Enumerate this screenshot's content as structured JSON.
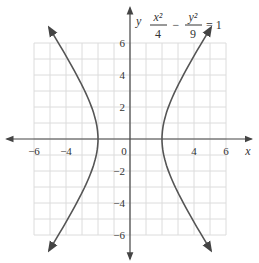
{
  "chart_data": {
    "type": "line",
    "equation": {
      "term1_num": "x²",
      "term1_den": "4",
      "minus": "−",
      "term2_num": "y²",
      "term2_den": "9",
      "rhs": "= 1"
    },
    "xlabel": "x",
    "ylabel": "y",
    "xlim": [
      -7,
      7
    ],
    "ylim": [
      -7,
      7
    ],
    "grid": true,
    "x_ticks": [
      "−6",
      "−4",
      "0",
      "4",
      "6"
    ],
    "y_ticks": [
      "6",
      "4",
      "2",
      "−2",
      "−4",
      "−6"
    ],
    "series": [
      {
        "name": "right branch",
        "x": [
          3.7,
          3.0,
          2.5,
          2.2,
          2.0,
          2.2,
          2.5,
          3.0,
          3.7
        ],
        "y": [
          -4.7,
          -3.35,
          -2.25,
          -1.37,
          0,
          1.37,
          2.25,
          3.35,
          4.7
        ]
      },
      {
        "name": "left branch",
        "x": [
          -3.7,
          -3.0,
          -2.5,
          -2.2,
          -2.0,
          -2.2,
          -2.5,
          -3.0,
          -3.7
        ],
        "y": [
          -4.7,
          -3.35,
          -2.25,
          -1.37,
          0,
          1.37,
          2.25,
          3.35,
          4.7
        ]
      }
    ],
    "vertices": [
      [
        -2,
        0
      ],
      [
        2,
        0
      ]
    ]
  },
  "colors": {
    "grid": "#dcdcdc",
    "axis": "#444444",
    "curve": "#555555"
  }
}
